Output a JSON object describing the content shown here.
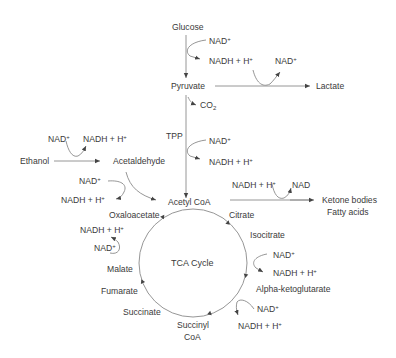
{
  "diagram": {
    "nodes": {
      "glucose": "Glucose",
      "pyruvate": "Pyruvate",
      "lactate": "Lactate",
      "ethanol": "Ethanol",
      "acetaldehyde": "Acetaldehyde",
      "acetyl_coa": "Acetyl CoA",
      "ketone_bodies": "Ketone bodies",
      "fatty_acids": "Fatty acids",
      "tca_cycle": "TCA Cycle",
      "oxaloacetate": "Oxaloacetate",
      "citrate": "Citrate",
      "isocitrate": "Isocitrate",
      "alpha_ketoglutarate": "Alpha-ketoglutarate",
      "succinyl_coa_line1": "Succinyl",
      "succinyl_coa_line2": "CoA",
      "succinate": "Succinate",
      "fumarate": "Fumarate",
      "malate": "Malate"
    },
    "cofactors": {
      "nad": "NAD",
      "nadh": "NADH + H",
      "plus": "+",
      "co2": "CO",
      "co2_sub": "2",
      "tpp": "TPP",
      "nad_plain": "NAD"
    },
    "edges": [
      {
        "from": "Glucose",
        "to": "Pyruvate",
        "cofactor": "NAD+ → NADH + H+"
      },
      {
        "from": "Pyruvate",
        "to": "Lactate",
        "cofactor": "NADH + H+ → NAD+"
      },
      {
        "from": "Pyruvate",
        "to": "Acetyl CoA",
        "cofactor": "CO2 released; TPP; NAD+ → NADH + H+"
      },
      {
        "from": "Ethanol",
        "to": "Acetaldehyde",
        "cofactor": "NAD+ → NADH + H+"
      },
      {
        "from": "Acetaldehyde",
        "to": "Acetyl CoA",
        "cofactor": "NAD+ → NADH + H+"
      },
      {
        "from": "Acetyl CoA",
        "to": "Ketone bodies / Fatty acids",
        "cofactor": "NADH + H+ → NAD"
      },
      {
        "from": "Oxaloacetate",
        "to": "Citrate"
      },
      {
        "from": "Citrate",
        "to": "Isocitrate"
      },
      {
        "from": "Isocitrate",
        "to": "Alpha-ketoglutarate",
        "cofactor": "NAD+ → NADH + H+"
      },
      {
        "from": "Alpha-ketoglutarate",
        "to": "Succinyl CoA",
        "cofactor": "NAD+ → NADH + H+"
      },
      {
        "from": "Succinyl CoA",
        "to": "Succinate"
      },
      {
        "from": "Succinate",
        "to": "Fumarate"
      },
      {
        "from": "Fumarate",
        "to": "Malate"
      },
      {
        "from": "Malate",
        "to": "Oxaloacetate",
        "cofactor": "NAD+ → NADH + H+"
      }
    ],
    "colors": {
      "line": "#7a7a7a",
      "text": "#3a3a3a",
      "background": "#ffffff"
    }
  }
}
